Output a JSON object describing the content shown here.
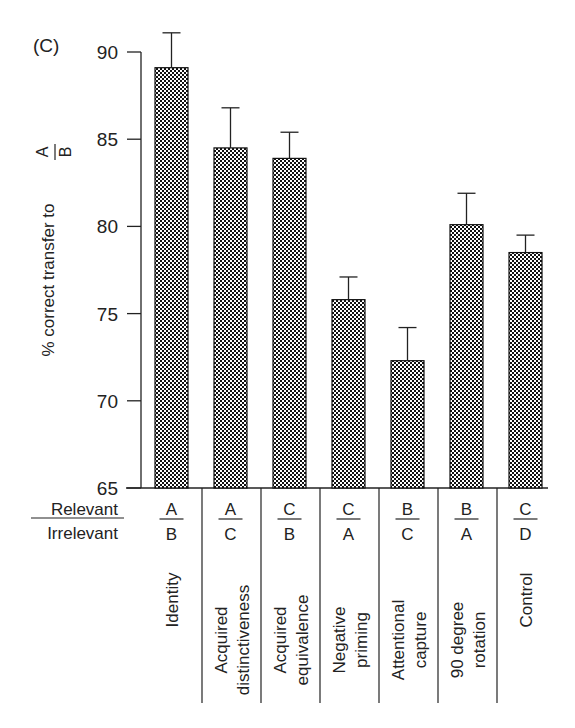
{
  "panel_label": "(C)",
  "colors": {
    "ink": "#1a1a1a",
    "background": "#ffffff"
  },
  "row_headers": {
    "top": "Relevant",
    "bottom": "Irrelevant"
  },
  "chart_data": {
    "type": "bar",
    "title": "",
    "panel": "(C)",
    "xlabel": "",
    "ylabel": "% correct transfer to A/B",
    "ylabel_main": "% correct transfer to",
    "ylabel_fraction": {
      "numerator": "A",
      "denominator": "B"
    },
    "ylim": [
      65,
      90
    ],
    "yticks": [
      65,
      70,
      75,
      80,
      85,
      90
    ],
    "grid": false,
    "legend": null,
    "categories": [
      "Identity",
      "Acquired distinctiveness",
      "Acquired equivalence",
      "Negative priming",
      "Attentional capture",
      "90 degree rotation",
      "Control"
    ],
    "category_lines": [
      [
        "Identity"
      ],
      [
        "Acquired",
        "distinctiveness"
      ],
      [
        "Acquired",
        "equivalence"
      ],
      [
        "Negative",
        "priming"
      ],
      [
        "Attentional",
        "capture"
      ],
      [
        "90 degree",
        "rotation"
      ],
      [
        "Control"
      ]
    ],
    "relevant": [
      "A",
      "A",
      "C",
      "C",
      "B",
      "B",
      "C"
    ],
    "irrelevant": [
      "B",
      "C",
      "B",
      "A",
      "C",
      "A",
      "D"
    ],
    "values": [
      89.1,
      84.5,
      83.9,
      75.8,
      72.3,
      80.1,
      78.5
    ],
    "error_upper": [
      91.1,
      86.8,
      85.4,
      77.1,
      74.2,
      81.9,
      79.5
    ],
    "bar_fill": "checkerboard"
  }
}
